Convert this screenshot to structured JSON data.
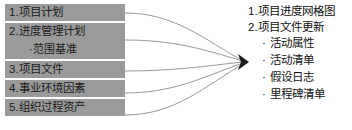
{
  "diagram": {
    "colors": {
      "box_fill": "#9a9a9a",
      "box_text": "#1a1a1a",
      "background": "#ffffff",
      "curve": "#8c8c8c",
      "arrow": "#1a1a1a",
      "output_text": "#111111"
    }
  },
  "inputs": {
    "items": [
      {
        "label": "1.项目计划"
      },
      {
        "label": "2.进度管理计划",
        "sub": "·范围基准"
      },
      {
        "label": "3.项目文件"
      },
      {
        "label": "4.事业环境因素"
      },
      {
        "label": "5.组织过程资产"
      }
    ]
  },
  "connector": {
    "icon": "arrow-right-icon",
    "curve_count": 5
  },
  "outputs": {
    "headings": [
      {
        "label": "1.项目进度网格图"
      },
      {
        "label": "2.项目文件更新"
      }
    ],
    "bullets": [
      {
        "dot": "·",
        "label": "活动属性"
      },
      {
        "dot": "·",
        "label": "活动清单"
      },
      {
        "dot": "·",
        "label": "假设日志"
      },
      {
        "dot": "·",
        "label": "里程碑清单"
      }
    ]
  }
}
